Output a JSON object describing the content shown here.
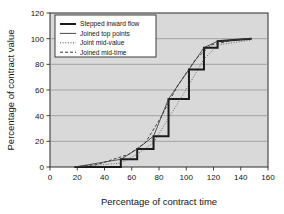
{
  "chart_data": {
    "type": "line",
    "title": "",
    "xlabel": "Percentage of contract time",
    "ylabel": "Percentage of contract value",
    "xlim": [
      0,
      160
    ],
    "ylim": [
      0,
      120
    ],
    "xticks": [
      0,
      20,
      40,
      60,
      80,
      100,
      120,
      140,
      160
    ],
    "yticks": [
      0,
      20,
      40,
      60,
      80,
      100,
      120
    ],
    "grid": "horizontal",
    "legend_position": "top-left",
    "plot_background": "#d9d9d9",
    "series": [
      {
        "name": "Stepped inward flow",
        "style": "solid-thick",
        "color": "#1a1a1a",
        "drawstyle": "steps-post",
        "x": [
          18,
          52,
          52,
          64,
          64,
          76,
          76,
          87,
          87,
          102,
          102,
          113,
          113,
          123,
          123,
          148
        ],
        "y": [
          0,
          0,
          6,
          6,
          14,
          14,
          24,
          24,
          53,
          53,
          76,
          76,
          93,
          93,
          98,
          100
        ]
      },
      {
        "name": "Joined top points",
        "style": "solid-thin",
        "color": "#333333",
        "x": [
          18,
          52,
          64,
          76,
          87,
          102,
          113,
          123,
          148
        ],
        "y": [
          0,
          6,
          14,
          24,
          53,
          76,
          93,
          98,
          100
        ]
      },
      {
        "name": "Joint mid-value",
        "style": "dotted",
        "color": "#4d4d4d",
        "x": [
          18,
          52,
          64,
          76,
          87,
          102,
          113,
          123,
          148
        ],
        "y": [
          0,
          3,
          10,
          19,
          38,
          64,
          84,
          95,
          99
        ]
      },
      {
        "name": "Joined mid-time",
        "style": "dashed",
        "color": "#333333",
        "x": [
          18,
          35,
          58,
          70,
          81,
          94,
          107,
          118,
          135,
          148
        ],
        "y": [
          0,
          2,
          10,
          19,
          38,
          64,
          84,
          95,
          99,
          100
        ]
      }
    ],
    "legend": [
      {
        "label": "Stepped inward flow",
        "style": "solid-thick"
      },
      {
        "label": "Joined top points",
        "style": "solid-thin"
      },
      {
        "label": "Joint mid-value",
        "style": "dotted"
      },
      {
        "label": "Joined mid-time",
        "style": "dashed"
      }
    ],
    "xtick_labels": [
      "0",
      "20",
      "40",
      "60",
      "80",
      "100",
      "120",
      "140",
      "160"
    ],
    "ytick_labels": [
      "0",
      "20",
      "40",
      "60",
      "80",
      "100",
      "120"
    ]
  }
}
